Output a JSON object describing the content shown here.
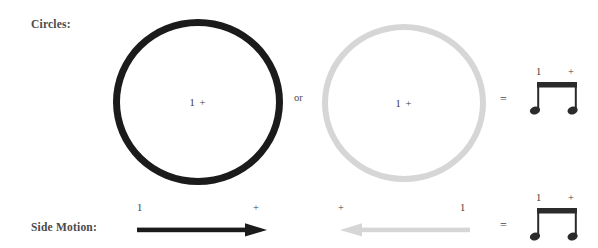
{
  "diagram": {
    "title_implied": "Circles and Side Motion rhythm diagram",
    "rows": [
      {
        "id": "circles",
        "label": "Circles:",
        "shapes": [
          {
            "kind": "ring",
            "color": "#1b1b1b",
            "caption": "1 +"
          },
          {
            "kind": "ring",
            "color": "#d6d6d6",
            "caption": "1 +"
          }
        ],
        "conjunction": "or",
        "equals": "=",
        "notation": {
          "beat_one": "1",
          "beat_and": "+",
          "note_count": 2,
          "note_type": "beamed-eighth-notes"
        }
      },
      {
        "id": "side-motion",
        "label": "Side Motion:",
        "arrows": [
          {
            "direction": "right",
            "color": "#1b1b1b",
            "start_mark": "1",
            "end_mark": "+"
          },
          {
            "direction": "left",
            "color": "#d6d6d6",
            "start_mark": "+",
            "end_mark": "1"
          }
        ],
        "equals": "=",
        "notation": {
          "beat_one": "1",
          "beat_and": "+",
          "note_count": 2,
          "note_type": "beamed-eighth-notes"
        }
      }
    ],
    "colors": {
      "dark": "#1b1b1b",
      "light": "#d6d6d6",
      "text": "#3a3a3a",
      "label": "#4a4a4a",
      "background": "#ffffff"
    }
  }
}
